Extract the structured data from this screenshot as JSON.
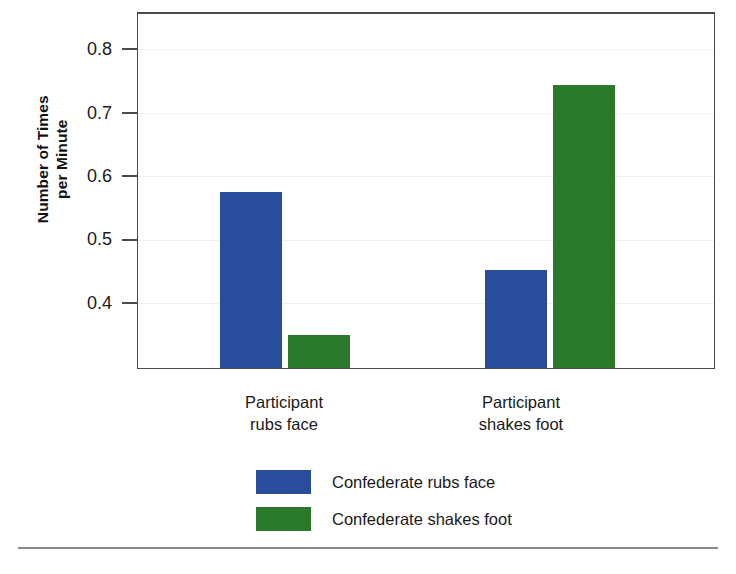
{
  "chart_data": {
    "type": "bar",
    "title": "",
    "xlabel": "",
    "ylabel": "Number of Times\nper Minute",
    "categories": [
      "Participant\nrubs face",
      "Participant\nshakes foot"
    ],
    "series": [
      {
        "name": "Confederate rubs face",
        "color": "#2a4d9b",
        "values": [
          0.57,
          0.45
        ]
      },
      {
        "name": "Confederate shakes foot",
        "color": "#2b7a2b",
        "values": [
          0.35,
          0.735
        ]
      }
    ],
    "ylim": [
      0.3,
      0.845
    ],
    "yticks": [
      0.8,
      0.7,
      0.6,
      0.5,
      0.4
    ],
    "ytick_labels": [
      "0.8",
      "0.7",
      "0.6",
      "0.5",
      "0.4"
    ],
    "grid": "horizontal",
    "legend_position": "bottom-center"
  },
  "axis": {
    "y_title": "Number of Times\nper Minute",
    "tick_labels": [
      "0.8",
      "0.7",
      "0.6",
      "0.5",
      "0.4"
    ]
  },
  "categories": [
    {
      "label": "Participant\nrubs face"
    },
    {
      "label": "Participant\nshakes foot"
    }
  ],
  "legend": {
    "items": [
      {
        "label": "Confederate rubs face",
        "color": "#2a4d9b"
      },
      {
        "label": "Confederate shakes foot",
        "color": "#2b7a2b"
      }
    ]
  },
  "colors": {
    "blue": "#2a4d9b",
    "green": "#2b7a2b",
    "frame": "#4a4a4a",
    "gridline": "#f0f0f0",
    "rule": "#8a8a8a"
  }
}
